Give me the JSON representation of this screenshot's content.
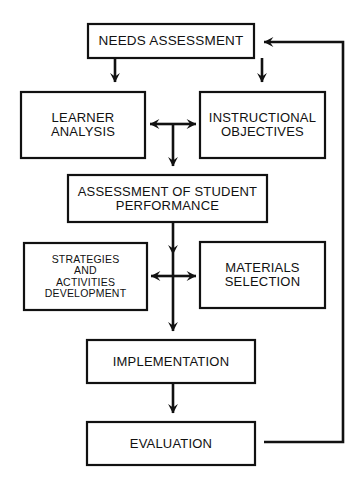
{
  "diagram": {
    "type": "flowchart",
    "colors": {
      "background": "#ffffff",
      "stroke": "#111111",
      "text": "#111111"
    },
    "nodes": [
      {
        "id": "needs",
        "label": "NEEDS ASSESSMENT",
        "x": 88,
        "y": 24,
        "width": 166,
        "height": 34
      },
      {
        "id": "learner",
        "label": "LEARNER\nANALYSIS",
        "x": 21,
        "y": 92,
        "width": 124,
        "height": 66
      },
      {
        "id": "objectives",
        "label": "INSTRUCTIONAL\nOBJECTIVES",
        "x": 200,
        "y": 92,
        "width": 125,
        "height": 66
      },
      {
        "id": "assessment",
        "label": "ASSESSMENT OF STUDENT\nPERFORMANCE",
        "x": 68,
        "y": 175,
        "width": 199,
        "height": 47
      },
      {
        "id": "strategies",
        "label": "STRATEGIES\nAND\nACTIVITIES\nDEVELOPMENT",
        "x": 24,
        "y": 243,
        "width": 123,
        "height": 67
      },
      {
        "id": "materials",
        "label": "MATERIALS\nSELECTION",
        "x": 200,
        "y": 242,
        "width": 125,
        "height": 66
      },
      {
        "id": "implement",
        "label": "IMPLEMENTATION",
        "x": 87,
        "y": 340,
        "width": 168,
        "height": 43
      },
      {
        "id": "evaluation",
        "label": "EVALUATION",
        "x": 87,
        "y": 422,
        "width": 168,
        "height": 43
      }
    ],
    "edges": [
      {
        "id": "needs-to-learner",
        "from": "needs",
        "to": "learner",
        "kind": "arrow-down"
      },
      {
        "id": "needs-to-objectives",
        "from": "needs",
        "to": "objectives",
        "kind": "arrow-down"
      },
      {
        "id": "learner-objectives",
        "from": "learner",
        "to": "objectives",
        "kind": "double-arrow-horizontal"
      },
      {
        "id": "to-assessment",
        "from": "objectives",
        "to": "assessment",
        "kind": "arrow-down"
      },
      {
        "id": "assessment-to-strategies",
        "from": "assessment",
        "to": "strategies",
        "kind": "arrow-down"
      },
      {
        "id": "strategies-materials",
        "from": "strategies",
        "to": "materials",
        "kind": "double-arrow-horizontal"
      },
      {
        "id": "to-implementation",
        "from": "strategies",
        "to": "implement",
        "kind": "arrow-down"
      },
      {
        "id": "implement-to-evaluation",
        "from": "implement",
        "to": "evaluation",
        "kind": "arrow-down"
      },
      {
        "id": "evaluation-feedback",
        "from": "evaluation",
        "to": "needs",
        "kind": "feedback-loop-right"
      }
    ]
  }
}
